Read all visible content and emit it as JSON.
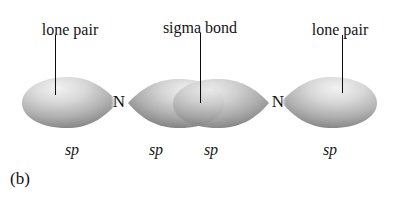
{
  "figure": {
    "caption": "(b)",
    "background_color": "#ffffff",
    "line_color": "#0d0d0d",
    "text_color": "#141414"
  },
  "annotations": [
    {
      "label": "lone pair",
      "x": 70,
      "y": 22
    },
    {
      "label": "sigma bond",
      "x": 200,
      "y": 20
    },
    {
      "label": "lone pair",
      "x": 340,
      "y": 22
    }
  ],
  "leaders": [
    {
      "name": "lone-pair-left-leader",
      "x": 55,
      "y": 35,
      "height": 60
    },
    {
      "name": "sigma-bond-leader",
      "x": 200,
      "y": 33,
      "height": 70
    },
    {
      "name": "lone-pair-right-leader",
      "x": 342,
      "y": 35,
      "height": 58
    }
  ],
  "atoms": [
    {
      "symbol": "N",
      "x": 119,
      "y": 101
    },
    {
      "symbol": "N",
      "x": 278,
      "y": 101
    }
  ],
  "orbitals": [
    {
      "name": "sp-orbital-lone-pair-left",
      "label": "sp",
      "label_x": 72,
      "label_y": 142,
      "orientation": "points-right"
    },
    {
      "name": "sp-orbital-bond-left",
      "label": "sp",
      "label_x": 156,
      "label_y": 142,
      "orientation": "points-left"
    },
    {
      "name": "sp-orbital-bond-right",
      "label": "sp",
      "label_x": 211,
      "label_y": 142,
      "orientation": "points-right"
    },
    {
      "name": "sp-orbital-lone-pair-right",
      "label": "sp",
      "label_x": 330,
      "label_y": 142,
      "orientation": "points-left"
    }
  ]
}
